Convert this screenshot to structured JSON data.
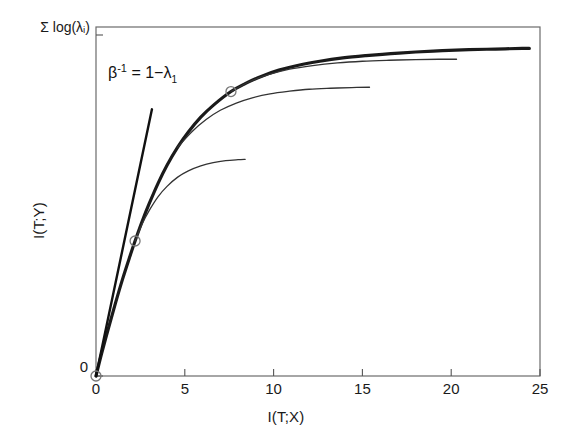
{
  "chart_data": {
    "type": "line",
    "title": "",
    "xlabel": "I(T;X)",
    "ylabel": "I(T;Y)",
    "xlim": [
      0,
      25
    ],
    "ylim": [
      0,
      1.06
    ],
    "xticks": [
      0,
      5,
      10,
      15,
      20,
      25
    ],
    "xticklabels": [
      "0",
      "5",
      "10",
      "15",
      "20",
      "25"
    ],
    "yticks": [
      0,
      1.0
    ],
    "yticklabels": [
      "0",
      "Σ log(λᵢ)"
    ],
    "grid": false,
    "legend": null,
    "annotations": [
      {
        "name": "tangent-slope-label",
        "text_plain": "β⁻¹ = 1−λ₁",
        "beta": "β",
        "beta_exponent": "-1",
        "equals": " = 1−",
        "lambda": "λ",
        "lambda_subscript": "1",
        "x": 0.95,
        "y": 0.9
      }
    ],
    "series": [
      {
        "name": "information-curve-envelope",
        "style": "thick-solid",
        "color": "#1a1a1a",
        "x": [
          0.0,
          0.3,
          0.7,
          1.1,
          1.5,
          1.9,
          2.2,
          2.6,
          3.0,
          3.5,
          4.0,
          4.6,
          5.2,
          5.9,
          6.6,
          7.6,
          8.4,
          9.3,
          10.3,
          11.4,
          12.6,
          13.9,
          15.2,
          16.6,
          18.0,
          19.5,
          21.0,
          22.5,
          24.0,
          24.4
        ],
        "y": [
          0.0,
          0.065,
          0.145,
          0.222,
          0.295,
          0.362,
          0.41,
          0.47,
          0.524,
          0.586,
          0.64,
          0.695,
          0.741,
          0.786,
          0.822,
          0.864,
          0.888,
          0.91,
          0.929,
          0.944,
          0.956,
          0.966,
          0.973,
          0.979,
          0.984,
          0.988,
          0.991,
          0.993,
          0.995,
          0.995
        ]
      },
      {
        "name": "branch-curve-1",
        "style": "thin-solid",
        "color": "#333333",
        "x": [
          2.2,
          2.6,
          3.0,
          3.5,
          4.0,
          4.6,
          5.2,
          5.9,
          6.6,
          7.3,
          8.0,
          8.4
        ],
        "y": [
          0.41,
          0.462,
          0.503,
          0.545,
          0.576,
          0.604,
          0.623,
          0.638,
          0.648,
          0.654,
          0.657,
          0.658
        ]
      },
      {
        "name": "branch-curve-2",
        "style": "thin-solid",
        "color": "#333333",
        "x": [
          4.6,
          5.4,
          6.2,
          7.0,
          7.9,
          8.8,
          9.8,
          10.9,
          12.0,
          13.2,
          14.4,
          15.4
        ],
        "y": [
          0.695,
          0.742,
          0.779,
          0.807,
          0.829,
          0.845,
          0.857,
          0.865,
          0.871,
          0.874,
          0.876,
          0.877
        ]
      },
      {
        "name": "branch-curve-3",
        "style": "thin-solid",
        "color": "#333333",
        "x": [
          7.6,
          8.6,
          9.7,
          10.9,
          12.2,
          13.6,
          15.0,
          16.5,
          18.0,
          19.3,
          20.3
        ],
        "y": [
          0.864,
          0.893,
          0.915,
          0.932,
          0.943,
          0.951,
          0.956,
          0.959,
          0.961,
          0.962,
          0.962
        ]
      },
      {
        "name": "tangent-line",
        "style": "straight-solid",
        "color": "#111111",
        "x": [
          0.0,
          3.15
        ],
        "y": [
          0.0,
          0.81
        ]
      }
    ],
    "markers": [
      {
        "name": "bifurcation-point-origin",
        "x": 0.0,
        "y": 0.0,
        "shape": "open-circle"
      },
      {
        "name": "bifurcation-point-1",
        "x": 2.2,
        "y": 0.41,
        "shape": "open-circle"
      },
      {
        "name": "bifurcation-point-2",
        "x": 7.6,
        "y": 0.864,
        "shape": "open-circle"
      }
    ]
  }
}
